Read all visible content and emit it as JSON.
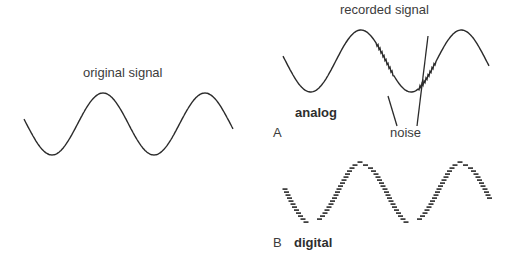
{
  "labels": {
    "original": "original signal",
    "recorded": "recorded signal",
    "analog": "analog",
    "panel_a": "A",
    "noise": "noise",
    "panel_b": "B",
    "digital": "digital"
  },
  "colors": {
    "stroke": "#2b2b2b",
    "text": "#3c3c3c"
  },
  "waves": {
    "original": {
      "x0": 24,
      "x1": 233,
      "ymid": 124,
      "amp": 31,
      "periods": 2.0,
      "phase_start": "mid-descending"
    },
    "recorded": {
      "x0": 283,
      "x1": 489,
      "ymid": 61,
      "amp": 31,
      "periods": 2.0,
      "noise_at": [
        [
          385,
          92
        ],
        [
          427,
          29
        ]
      ]
    },
    "digital": {
      "x0": 285,
      "x1": 490,
      "ymid": 193,
      "amp": 30,
      "periods": 2.0,
      "dash_width": 5,
      "step": 3
    }
  },
  "noise_pointers": [
    {
      "from": [
        388,
        96
      ],
      "to": [
        397,
        126
      ]
    },
    {
      "from": [
        428,
        36
      ],
      "to": [
        417,
        126
      ]
    }
  ]
}
